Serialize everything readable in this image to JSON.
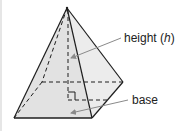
{
  "diagram": {
    "labels": {
      "height_text": "height (",
      "height_var": "h",
      "height_close": ")",
      "base": "base"
    },
    "colors": {
      "front_face": "#e2e2e2",
      "right_face": "#ececec",
      "edge": "#1e1e1e",
      "arrow": "#8a8a8a",
      "border": "#e6e6e6"
    }
  }
}
